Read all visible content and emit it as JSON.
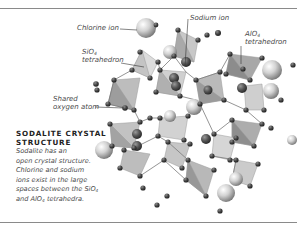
{
  "figure": {
    "title": "SODALITE CRYSTAL STRUCTURE",
    "caption": {
      "line1": "Sodalite has an",
      "line2": "open crystal structure.",
      "line3": "Chlorine and sodium",
      "line4": "ions exist in the large",
      "line5_pre": "spaces between the SiO",
      "line5_sub": "4",
      "line6_pre": "and AlO",
      "line6_sub": "4",
      "line6_post": " tetrahedra."
    },
    "labels": {
      "chlorine_ion": "Chlorine ion",
      "sio4_formula": "SiO",
      "sio4_sub": "4",
      "sio4_word": "tetrahedron",
      "sodium_ion": "Sodium ion",
      "alo4_formula": "AlO",
      "alo4_sub": "4",
      "alo4_word": "tetrahedron",
      "shared_oxygen_line1": "Shared",
      "shared_oxygen_line2": "oxygen atom"
    },
    "colors": {
      "rule": "#8a8a8a",
      "label_text": "#4a4a4a",
      "title_text": "#222222",
      "tetrahedron_light": "#d6d6d6",
      "tetrahedron_mid": "#b5b5b5",
      "tetrahedron_dark": "#8f8f8f",
      "oxygen_atom": "#3c3c3c",
      "sodium_ion": "#4a4a4a",
      "chlorine_ion": "#cfcfcf"
    }
  }
}
